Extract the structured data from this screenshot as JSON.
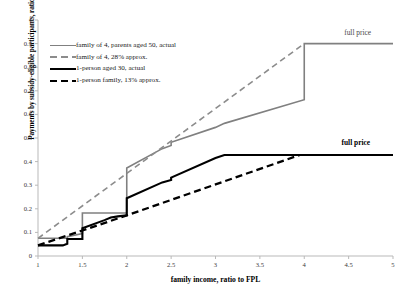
{
  "chart_data": {
    "type": "line",
    "title": "",
    "xlabel": "family income, ratio to FPL",
    "ylabel": "Payments by subsidy-eligible participants, ratio to FPL",
    "xlim": [
      1,
      5
    ],
    "ylim": [
      0,
      1
    ],
    "xticks": [
      "1",
      "1.5",
      "2",
      "2.5",
      "3",
      "3.5",
      "4",
      "4.5",
      "5"
    ],
    "yticks": [
      "0",
      "0.1",
      "0.2",
      "0.3",
      "0.4",
      "0.5",
      "0.6",
      "0.7",
      "0.8",
      "0.9",
      "1"
    ],
    "grid": false,
    "legend_position": "upper-left",
    "series": [
      {
        "name": "family of 4, parents aged 50, actual",
        "style": "solid",
        "color": "#808080",
        "width": 1.6,
        "points": [
          [
            1.0,
            0.075
          ],
          [
            1.33,
            0.075
          ],
          [
            1.33,
            0.082
          ],
          [
            1.5,
            0.095
          ],
          [
            1.5,
            0.182
          ],
          [
            2.0,
            0.182
          ],
          [
            2.0,
            0.373
          ],
          [
            2.4,
            0.455
          ],
          [
            2.5,
            0.468
          ],
          [
            2.5,
            0.482
          ],
          [
            3.0,
            0.545
          ],
          [
            3.1,
            0.562
          ],
          [
            4.0,
            0.662
          ],
          [
            4.0,
            0.9
          ],
          [
            5.0,
            0.9
          ]
        ]
      },
      {
        "name": "family of 4, 28% approx.",
        "style": "dashed",
        "color": "#8c8c8c",
        "width": 1.6,
        "points": [
          [
            1.0,
            0.075
          ],
          [
            4.0,
            0.9
          ]
        ]
      },
      {
        "name": "1-person aged 30, actual",
        "style": "solid",
        "color": "#000000",
        "width": 2.1,
        "points": [
          [
            1.0,
            0.045
          ],
          [
            1.28,
            0.045
          ],
          [
            1.33,
            0.052
          ],
          [
            1.33,
            0.072
          ],
          [
            1.5,
            0.072
          ],
          [
            1.5,
            0.118
          ],
          [
            1.75,
            0.152
          ],
          [
            1.82,
            0.163
          ],
          [
            1.9,
            0.168
          ],
          [
            2.0,
            0.172
          ],
          [
            2.0,
            0.245
          ],
          [
            2.4,
            0.312
          ],
          [
            2.5,
            0.322
          ],
          [
            2.5,
            0.332
          ],
          [
            3.0,
            0.415
          ],
          [
            3.1,
            0.428
          ],
          [
            4.0,
            0.428
          ],
          [
            5.0,
            0.428
          ]
        ]
      },
      {
        "name": "1-person family, 13% approx.",
        "style": "dashed",
        "color": "#000000",
        "width": 2.3,
        "points": [
          [
            1.0,
            0.045
          ],
          [
            1.5,
            0.108
          ],
          [
            2.0,
            0.172
          ],
          [
            3.95,
            0.428
          ]
        ]
      }
    ],
    "annotations": [
      {
        "text": "full price",
        "x": 4.45,
        "y": 0.945,
        "color": "#4a4a4a",
        "bold": false
      },
      {
        "text": "full price",
        "x": 4.42,
        "y": 0.478,
        "color": "#000000",
        "bold": true
      }
    ]
  },
  "legend": {
    "items": [
      {
        "label": "family of 4, parents aged 50, actual"
      },
      {
        "label": "family of 4, 28% approx."
      },
      {
        "label": "1-person aged 30, actual"
      },
      {
        "label": "1-person family, 13% approx."
      }
    ]
  },
  "axes": {
    "x_title": "family income, ratio to FPL",
    "y_title": "Payments by subsidy-eligible participants, ratio to FPL"
  },
  "annotations": {
    "full_price_upper": "full price",
    "full_price_lower": "full price"
  }
}
